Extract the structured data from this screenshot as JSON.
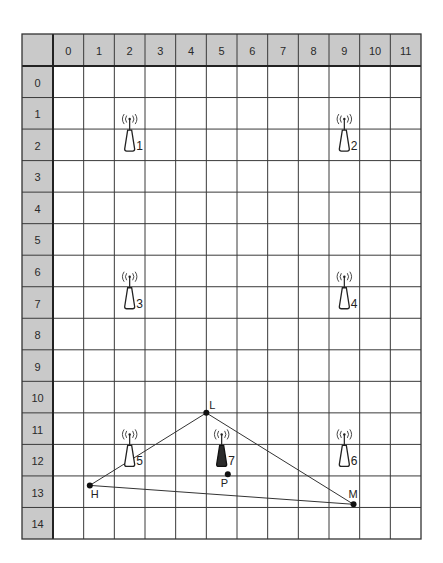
{
  "diagram": {
    "type": "grid-map",
    "grid": {
      "columns": [
        "0",
        "1",
        "2",
        "3",
        "4",
        "5",
        "6",
        "7",
        "8",
        "9",
        "10",
        "11"
      ],
      "rows": [
        "0",
        "1",
        "2",
        "3",
        "4",
        "5",
        "6",
        "7",
        "8",
        "9",
        "10",
        "11",
        "12",
        "13",
        "14"
      ],
      "header_color": "#c9c9c9",
      "line_color": "#3a3a3a"
    },
    "towers": [
      {
        "label": "1",
        "col": 2,
        "row": 2,
        "filled": false
      },
      {
        "label": "2",
        "col": 9,
        "row": 2,
        "filled": false
      },
      {
        "label": "3",
        "col": 2,
        "row": 7,
        "filled": false
      },
      {
        "label": "4",
        "col": 9,
        "row": 7,
        "filled": false
      },
      {
        "label": "5",
        "col": 2,
        "row": 12,
        "filled": false
      },
      {
        "label": "6",
        "col": 9,
        "row": 12,
        "filled": false
      },
      {
        "label": "7",
        "col": 5,
        "row": 12,
        "filled": true
      }
    ],
    "points": [
      {
        "label": "L",
        "x": 5.0,
        "y": 11.0
      },
      {
        "label": "H",
        "x": 1.2,
        "y": 13.3
      },
      {
        "label": "M",
        "x": 9.8,
        "y": 13.9
      },
      {
        "label": "P",
        "x": 5.7,
        "y": 12.95
      }
    ],
    "triangle": [
      "L",
      "H",
      "M"
    ]
  }
}
